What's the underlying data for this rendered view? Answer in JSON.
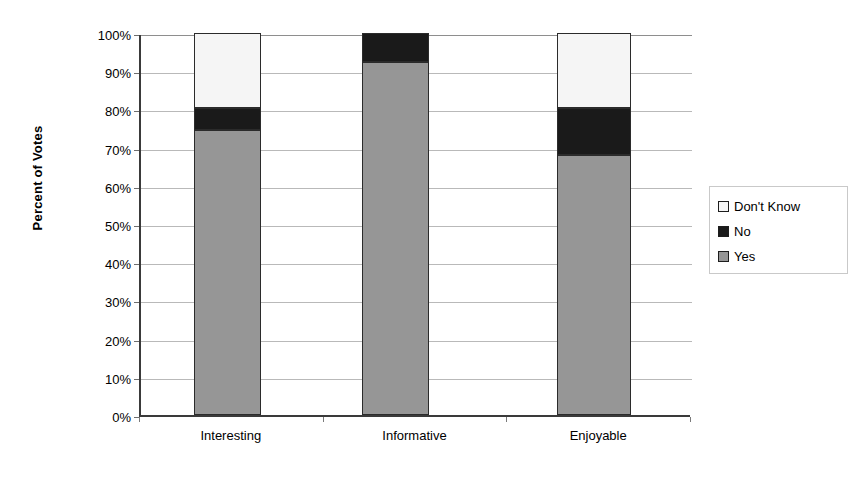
{
  "chart_data": {
    "type": "bar",
    "title": "",
    "subtitle": "",
    "xlabel": "",
    "ylabel": "Percent of Votes",
    "stacked": true,
    "stack_mode": "percent",
    "grid": true,
    "legend_position": "right",
    "ylim": [
      0,
      100
    ],
    "y_ticks": [
      "0%",
      "10%",
      "20%",
      "30%",
      "40%",
      "50%",
      "60%",
      "70%",
      "80%",
      "90%",
      "100%"
    ],
    "y_tick_values": [
      0,
      10,
      20,
      30,
      40,
      50,
      60,
      70,
      80,
      90,
      100
    ],
    "categories": [
      "Interesting",
      "Informative",
      "Enjoyable"
    ],
    "series": [
      {
        "name": "Yes",
        "color": "#969696",
        "values": [
          74.5,
          92.5,
          68.0
        ]
      },
      {
        "name": "No",
        "color": "#1a1a1a",
        "values": [
          6.0,
          7.5,
          12.5
        ]
      },
      {
        "name": "Don't Know",
        "color": "#f5f5f5",
        "values": [
          19.5,
          0.0,
          19.5
        ]
      }
    ],
    "legend_order": [
      "Don't Know",
      "No",
      "Yes"
    ],
    "annotations": []
  },
  "axis": {
    "y_title": "Percent of Votes"
  },
  "legend": {
    "items": [
      {
        "label": "Don't Know",
        "color": "#f5f5f5"
      },
      {
        "label": "No",
        "color": "#1a1a1a"
      },
      {
        "label": "Yes",
        "color": "#969696"
      }
    ]
  },
  "colors": {
    "yes": "#969696",
    "no": "#1a1a1a",
    "dont_know": "#f5f5f5",
    "axis": "#3a3a3a",
    "grid": "#b9b9b9",
    "background": "#ffffff"
  }
}
